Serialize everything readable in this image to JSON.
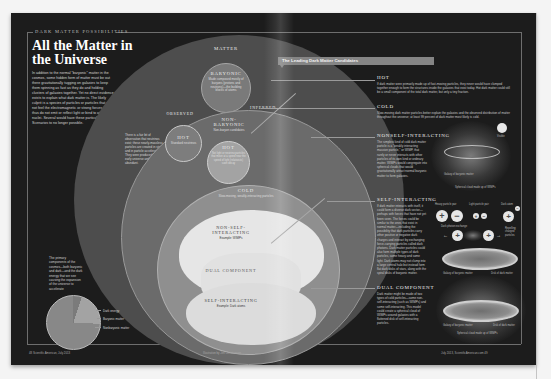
{
  "left_page": {
    "kicker": "Dark Matter Possibilities",
    "title": "All the Matter in the Universe",
    "intro": "In addition to the normal \"baryonic\" matter in the cosmos, some hidden form of matter must be out there gravitationally tugging on galaxies to keep them spinning as fast as they do and holding clusters of galaxies together. Yet no direct evidence exists to explain what dark matter is. The likely culprit is a species of particles or particles that do not feel the electromagnetic or strong forces and thus do not emit or reflect light or bind to atomic nuclei. Several would have these particular roles. Scenarios to no longer possible.",
    "pie_note": "The primary components of the cosmos—both baryonic and dark—and the dark energy that we see causing the expansion of the universe to accelerate",
    "pie_legend": [
      "Dark energy",
      "Baryonic matter",
      "Nonbaryonic matter"
    ],
    "footer_left": "48  Scientific American, July 2013",
    "footer_center": "Illustration by Jen Christiansen"
  },
  "diagram": {
    "matter": "Matter",
    "baryonic": {
      "label": "Baryonic",
      "desc": "Made composed mostly of baryons (protons and neutrons)—the building blocks of atoms"
    },
    "observed": "Observed",
    "inferred": "Inferred",
    "observed_note": "There is a fair bit of observation that neutrinos exist; these nearly-massless particles are created in stars and in particle accelerators. They were produced in the early universe and are still very abundant.",
    "hot_observed": {
      "label": "Hot",
      "desc": "Standard neutrinos"
    },
    "nonbaryonic": {
      "label": "Non-Baryonic",
      "desc": "Non-baryon candidates"
    },
    "hot": {
      "label": "Hot",
      "desc": "Not light or neutrino particles that move at a speed near the speed of light (relativistic) soon decay"
    },
    "cold": {
      "label": "Cold",
      "desc": "Slow-moving, weakly-interacting particles"
    },
    "non_self_interacting": {
      "label": "Non-Self-Interacting",
      "example": "Example: WIMPs"
    },
    "dual_component": {
      "label": "Dual Component"
    },
    "self_interacting": {
      "label": "Self-Interacting",
      "example": "Example: Dark atoms"
    }
  },
  "right_page": {
    "banner": "The Leading Dark Matter Candidates",
    "sections": [
      {
        "title": "Hot",
        "body": "If dark matter were primarily made up of fast-moving particles, they never would have clumped together enough to form the structures inside the galaxies that exist today. Hot dark matter could still be a small component of the total dark matter, but only a tiny fraction."
      },
      {
        "title": "Cold",
        "body": "Slow-moving dark matter particles better explain the galaxies and the observed distribution of matter throughout the universe; at least 99 percent of dark matter most likely is cold."
      },
      {
        "title": "Nonself-Interacting",
        "body": "The simplest kind of cold dark matter particle is a \"weakly interacting massive particle,\" or WIMP, that rarely or never interacts with other particles of its own kind or ordinary matter. WIMPs would congregate into spherical clouds that would gravitationally attract normal baryonic matter to form galaxies."
      },
      {
        "title": "Self-Interacting",
        "body": "If dark matter interacts with itself, it could form a diverse dark sector—perhaps with forces that have not yet been seen. The forces could be similar to the ones that exist in normal matter—including the possibility that dark particles carry other positive or negative dark charges and interact by exchanging force-carrying particles called dark photons. Dark matter particles could also form multiple types of dark particles, some heavy and some light. Dark atoms may not clump into a large central halo but instead form flat dark disks of stars, along with the spiral disks of baryonic matter."
      },
      {
        "title": "Dual Component",
        "body": "Dark matter might be made of two types of cold particles—some non-self-interacting (such as WIMPs) and some self-interacting. This model could create a spherical cloud of WIMPs around galaxies with a flattened disk of self-interacting particles."
      }
    ],
    "illustrations": {
      "nsi_labels": [
        "Visible",
        "Galaxy of baryonic matter",
        "Spherical cloud made up of WIMPs"
      ],
      "si_labels": {
        "heavy_pair": "Heavy particle pair",
        "light_pair": "Light particle pair",
        "dark_atom": "Dark atom",
        "photon_exchange": "Dark photon exchange",
        "repelling": "Repelling charged particles",
        "disk_baryonic": "Galaxy of baryonic matter",
        "disk_dark": "Disk of dark matter"
      },
      "dual_labels": [
        "Galaxy of baryonic matter",
        "Disk of dark matter",
        "Spherical cloud made up of WIMPs"
      ],
      "symbols": {
        "plus": "+",
        "minus": "−"
      }
    },
    "footer_right": "July 2013, ScientificAmerican.com  49"
  },
  "colors": {
    "page_bg": "#1c1c1c",
    "matter_circle": "#4d4d4d",
    "nonbaryonic_circle": "#6b6b6b",
    "cold_circle": "#8f8f8f",
    "inner_light": "#e6e6e6",
    "banner": "#858585"
  }
}
